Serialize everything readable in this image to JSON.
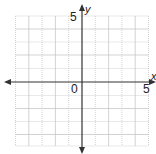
{
  "graph": {
    "x_axis_label": "x",
    "y_axis_label": "y",
    "origin_label": "0",
    "x_tick_label": "5",
    "y_tick_label": "5",
    "x_range": [
      -5,
      5
    ],
    "y_range": [
      -5,
      5
    ],
    "grid_step": 1,
    "colors": {
      "grid": "#c8c8c8",
      "axis": "#333333",
      "text": "#222222"
    }
  }
}
